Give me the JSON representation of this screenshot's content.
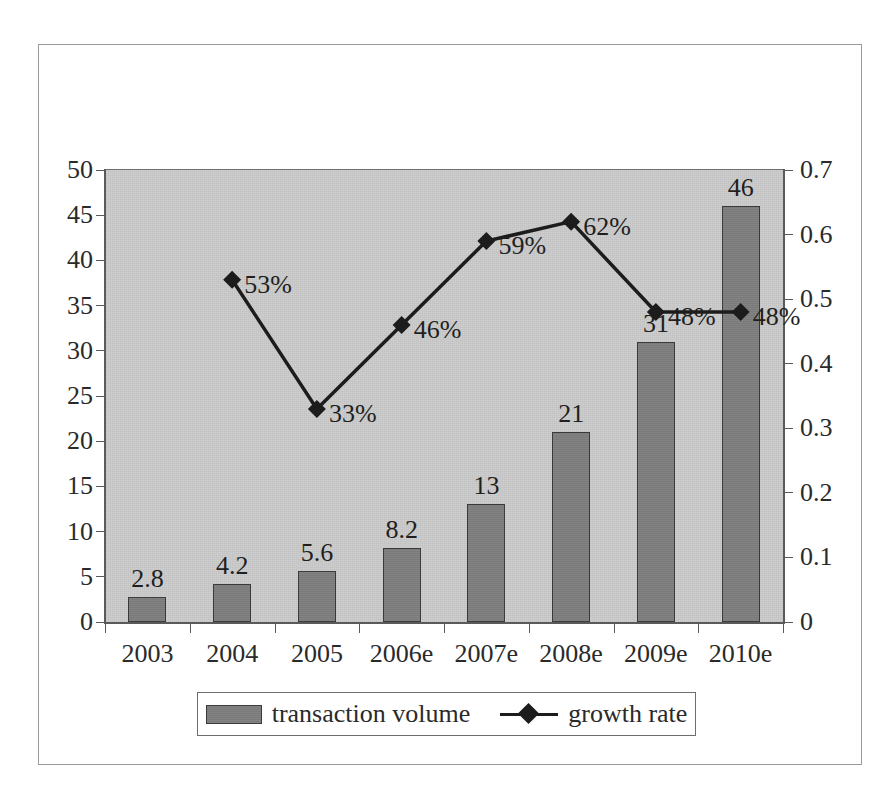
{
  "chart_data": {
    "type": "bar",
    "title": "",
    "subtitle": "",
    "xlabel": "",
    "ylabel": "",
    "categories": [
      "2003",
      "2004",
      "2005",
      "2006e",
      "2007e",
      "2008e",
      "2009e",
      "2010e"
    ],
    "series": [
      {
        "name": "transaction volume",
        "type": "bar",
        "axis": "left",
        "values": [
          2.8,
          4.2,
          5.6,
          8.2,
          13,
          21,
          31,
          46
        ],
        "data_labels": [
          "2.8",
          "4.2",
          "5.6",
          "8.2",
          "13",
          "21",
          "31",
          "46"
        ],
        "color": "#7a7a7a"
      },
      {
        "name": "growth rate",
        "type": "line",
        "axis": "right",
        "marker": "diamond",
        "values": [
          null,
          0.53,
          0.33,
          0.46,
          0.59,
          0.62,
          0.48,
          0.48
        ],
        "data_labels": [
          "",
          "53%",
          "33%",
          "46%",
          "59%",
          "62%",
          "48%",
          "48%"
        ],
        "color": "#1c1c1c"
      }
    ],
    "left_axis": {
      "ticks": [
        "0",
        "5",
        "10",
        "15",
        "20",
        "25",
        "30",
        "35",
        "40",
        "45",
        "50"
      ],
      "min": 0,
      "max": 50,
      "step": 5
    },
    "right_axis": {
      "ticks": [
        "0",
        "0.1",
        "0.2",
        "0.3",
        "0.4",
        "0.5",
        "0.6",
        "0.7"
      ],
      "min": 0,
      "max": 0.7,
      "step": 0.1
    },
    "legend": {
      "position": "bottom",
      "entries": [
        "transaction volume",
        "growth rate"
      ]
    },
    "grid": false,
    "plot_background": "#c2c2c2"
  }
}
